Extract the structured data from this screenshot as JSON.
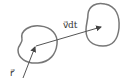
{
  "diagram": {
    "type": "vector-displacement",
    "labels": {
      "position_vector": "r⃗",
      "displacement_vector": "v⃗dt"
    },
    "colors": {
      "stroke": "#555555",
      "blob": "#777777",
      "text": "#333333"
    },
    "regions": [
      {
        "name": "initial-region"
      },
      {
        "name": "displaced-region"
      }
    ]
  }
}
